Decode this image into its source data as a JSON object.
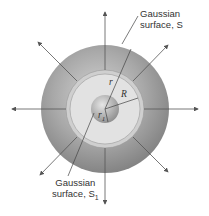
{
  "diagram": {
    "labels": {
      "surface_s_line1": "Gaussian",
      "surface_s_line2": "surface, S",
      "surface_s1_line1": "Gaussian",
      "surface_s1_line2": "surface, S",
      "surface_s1_sub": "1",
      "radius_r": "r",
      "radius_R": "R",
      "radius_r1": "r",
      "radius_r1_sub": "1"
    },
    "colors": {
      "outer_sphere": "#8a8a8a",
      "outer_sphere_light": "#c9c9c9",
      "shell_fill": "#dedede",
      "ring": "#c6c6c6",
      "inner_sphere": "#9a9a9a",
      "lines": "#555555"
    },
    "field_arrows": 8
  }
}
